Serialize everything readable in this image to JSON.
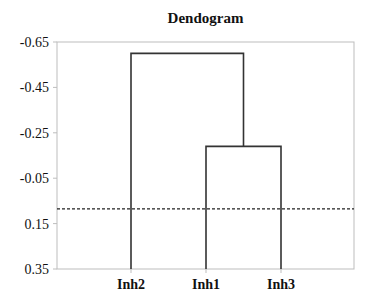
{
  "chart_data": {
    "type": "dendrogram",
    "title": "Dendogram",
    "xlabel": "",
    "ylabel": "",
    "ylim": [
      -0.65,
      0.35
    ],
    "y_inverted": true,
    "y_ticks": [
      -0.65,
      -0.45,
      -0.25,
      -0.05,
      0.15,
      0.35
    ],
    "y_tick_labels": [
      "-0.65",
      "-0.45",
      "-0.25",
      "-0.05",
      "0.15",
      "0.35"
    ],
    "leaves": [
      "Inh2",
      "Inh1",
      "Inh3"
    ],
    "leaf_baseline": 0.35,
    "merges": [
      {
        "left": "Inh1",
        "right": "Inh3",
        "height": -0.19
      },
      {
        "left": "Inh2",
        "right": "(Inh1,Inh3)",
        "height": -0.6
      }
    ],
    "cut_line": {
      "value": 0.085,
      "style": "dashed"
    },
    "grid": false,
    "legend": null
  },
  "colors": {
    "line": "#333333",
    "frame": "#bdbdbd",
    "dashed": "#222222",
    "background": "#ffffff"
  }
}
